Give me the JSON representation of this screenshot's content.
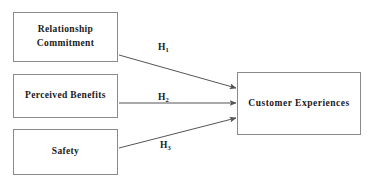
{
  "diagram": {
    "type": "conceptual-path-diagram",
    "colors": {
      "box_border": "#8a8a8a",
      "arrow": "#555555",
      "text": "#1a1a1a",
      "background": "#ffffff"
    },
    "independent_variables": [
      {
        "id": "relationship-commitment",
        "label": "Relationship\nCommitment"
      },
      {
        "id": "perceived-benefits",
        "label": "Perceived Benefits"
      },
      {
        "id": "safety",
        "label": "Safety"
      }
    ],
    "dependent_variable": {
      "id": "customer-experiences",
      "label": "Customer Experiences"
    },
    "hypotheses": [
      {
        "id": "h1",
        "letter": "H",
        "subscript": "1",
        "from": "relationship-commitment",
        "to": "customer-experiences"
      },
      {
        "id": "h2",
        "letter": "H",
        "subscript": "2",
        "from": "perceived-benefits",
        "to": "customer-experiences"
      },
      {
        "id": "h3",
        "letter": "H",
        "subscript": "3",
        "from": "safety",
        "to": "customer-experiences"
      }
    ]
  }
}
